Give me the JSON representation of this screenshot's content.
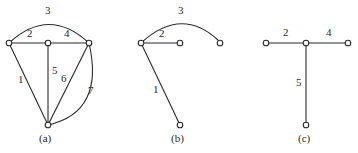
{
  "panels": [
    {
      "id": "a",
      "caption": "(a)",
      "edge_labels": {
        "e1": "1",
        "e2": "2",
        "e3": "3",
        "e4": "4",
        "e5": "5",
        "e6": "6",
        "e7": "7"
      }
    },
    {
      "id": "b",
      "caption": "(b)",
      "edge_labels": {
        "e1": "1",
        "e2": "2",
        "e3": "3"
      }
    },
    {
      "id": "c",
      "caption": "(c)",
      "edge_labels": {
        "e2": "2",
        "e4": "4",
        "e5": "5"
      }
    }
  ],
  "colors": {
    "stroke": "#2a2a2a",
    "background": "#ffffff"
  }
}
